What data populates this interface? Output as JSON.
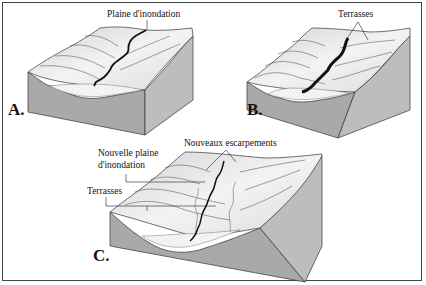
{
  "figure": {
    "panels": [
      {
        "id": "A",
        "label": "A.",
        "annotations": [
          "Plaine d'inondation"
        ]
      },
      {
        "id": "B",
        "label": "B.",
        "annotations": [
          "Terrasses"
        ]
      },
      {
        "id": "C",
        "label": "C.",
        "annotations": [
          "Nouveaux escarpements",
          "Nouvelle plaine",
          "d'inondation",
          "Terrasses"
        ]
      }
    ],
    "colors": {
      "border": "#444444",
      "side_face": "#a8a8a8",
      "surface_light": "#efefef",
      "surface_shade": "#c9c9c9",
      "river": "#111111"
    }
  }
}
